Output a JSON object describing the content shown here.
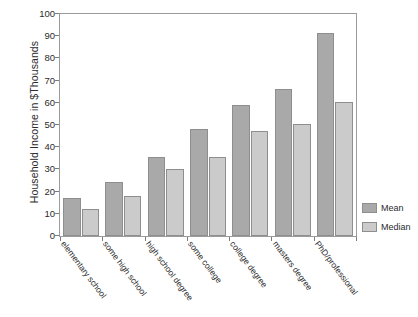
{
  "chart_data": {
    "type": "bar",
    "title": "",
    "xlabel": "",
    "ylabel": "Household Income in $Thousands",
    "ylim": [
      0,
      100
    ],
    "ytick_step": 10,
    "yticks": [
      "0",
      "10",
      "20",
      "30",
      "40",
      "50",
      "60",
      "70",
      "80",
      "90",
      "100"
    ],
    "grid": false,
    "legend_position": "right",
    "categories": [
      "elementary school",
      "some high school",
      "high school degree",
      "some college",
      "college degree",
      "masters degree",
      "PhD/professional"
    ],
    "series": [
      {
        "name": "Mean",
        "color": "#a9a9a9",
        "values": [
          17,
          24.5,
          35.5,
          48,
          59,
          66,
          91.5
        ]
      },
      {
        "name": "Median",
        "color": "#cbcbcb",
        "values": [
          12,
          18,
          30,
          35.5,
          47.5,
          50.5,
          60.5
        ]
      }
    ]
  },
  "legend": {
    "items": [
      {
        "label": "Mean",
        "swatch": "mean"
      },
      {
        "label": "Median",
        "swatch": "median"
      }
    ]
  },
  "colors": {
    "mean": "#a9a9a9",
    "median": "#cbcbcb",
    "axis": "#9b9b9b",
    "text": "#2b2b2b",
    "background": "#ffffff"
  }
}
